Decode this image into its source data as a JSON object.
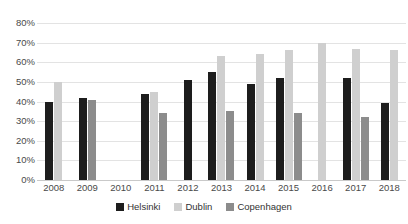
{
  "chart_data": {
    "type": "bar",
    "title": "",
    "xlabel": "",
    "ylabel": "",
    "ylim": [
      0,
      0.8
    ],
    "grid": true,
    "legend_position": "bottom",
    "categories": [
      "2008",
      "2009",
      "2010",
      "2011",
      "2012",
      "2013",
      "2014",
      "2015",
      "2016",
      "2017",
      "2018"
    ],
    "ytick_labels": [
      "80%",
      "70%",
      "60%",
      "50%",
      "40%",
      "30%",
      "20%",
      "10%",
      "0%"
    ],
    "ytick_values": [
      80,
      70,
      60,
      50,
      40,
      30,
      20,
      10,
      0
    ],
    "series": [
      {
        "name": "Helsinki",
        "color": "#1d1d1d",
        "values": [
          40,
          42,
          null,
          44,
          51,
          55,
          49,
          52,
          null,
          52,
          39
        ]
      },
      {
        "name": "Dublin",
        "color": "#cfcfcf",
        "values": [
          50,
          null,
          null,
          45,
          null,
          63,
          64,
          66,
          70,
          67,
          66
        ]
      },
      {
        "name": "Copenhagen",
        "color": "#8c8c8c",
        "values": [
          null,
          41,
          null,
          34,
          null,
          35,
          null,
          34,
          null,
          32,
          null
        ]
      }
    ]
  },
  "legend": {
    "items": [
      {
        "label": "Helsinki",
        "swatch": "helsinki"
      },
      {
        "label": "Dublin",
        "swatch": "dublin"
      },
      {
        "label": "Copenhagen",
        "swatch": "copenhagen"
      }
    ]
  },
  "title_strip": {
    "text": ""
  }
}
